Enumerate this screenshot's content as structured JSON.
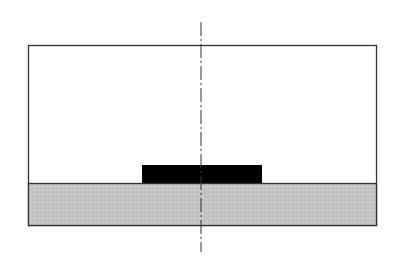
{
  "diagram": {
    "type": "cross-section",
    "colors": {
      "background": "#ffffff",
      "outline": "#333333",
      "substrate_fill": "#c4c4c4",
      "block_fill": "#000000",
      "centerline": "#333333"
    },
    "outer_box": {
      "x": 28,
      "y": 45,
      "width": 349,
      "height": 181
    },
    "substrate": {
      "x": 28,
      "y": 183,
      "width": 349,
      "height": 43
    },
    "block": {
      "x": 142,
      "y": 165,
      "width": 120,
      "height": 18
    },
    "centerline": {
      "x": 201,
      "y1": 22,
      "y2": 252,
      "style": "dash-dot"
    }
  }
}
